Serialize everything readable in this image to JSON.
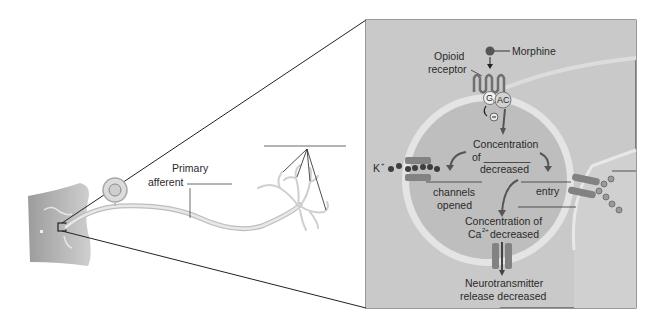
{
  "diagram": {
    "type": "neuron-opioid-mechanism",
    "left_panel": {
      "primary_afferent_label_line1": "Primary",
      "primary_afferent_label_line2": "afferent"
    },
    "inset": {
      "morphine_label": "Morphine",
      "opioid_receptor_line1": "Opioid",
      "opioid_receptor_line2": "receptor",
      "gi_label": "G",
      "gi_subscript": "i",
      "ac_label": "AC",
      "inhibit_symbol": "−",
      "concentration_line1": "Concentration",
      "concentration_line2": "of ________",
      "concentration_line3": "decreased",
      "k_label": "K",
      "k_sup": "+",
      "channels_opened_line1": "channels",
      "channels_opened_line2": "opened",
      "entry_label": "entry",
      "ca_conc_line1": "Concentration of",
      "ca_conc_line2_prefix": "Ca",
      "ca_conc_sup": "2+",
      "ca_conc_line2_suffix": " decreased",
      "nt_release_line1": "Neurotransmitter",
      "nt_release_line2": "release decreased"
    },
    "colors": {
      "inset_bg": "#c9c9c9",
      "cell_fill": "#bdbdbd",
      "membrane": "#e6e6e6",
      "skin": "#b8b8b8",
      "dark_mark": "#4a4a4a",
      "channel": "#7d7d7d"
    }
  }
}
